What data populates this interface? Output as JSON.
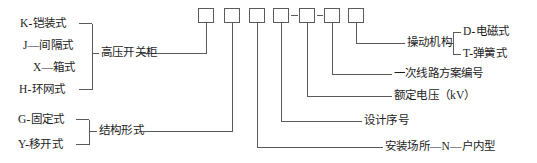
{
  "diagram": {
    "type": "code-breakdown-bracket-diagram",
    "line_color": "#5a5a5a",
    "text_color": "#1d1d1d",
    "background": "#ffffff",
    "code_boxes": {
      "count": 7,
      "separators": [
        "",
        "",
        "",
        "-",
        "-",
        "",
        ""
      ],
      "dash_label": "-"
    },
    "left_groups": [
      {
        "name": "cabinet-type-group",
        "items": [
          {
            "code": "K",
            "sep": "-",
            "text": "铠装式",
            "label": "K-铠装式"
          },
          {
            "code": "J",
            "sep": "-",
            "text": "间隔式",
            "label": "J—间隔式"
          },
          {
            "code": "X",
            "sep": "-",
            "text": "箱式",
            "label": "X—箱式"
          },
          {
            "code": "H",
            "sep": "-",
            "text": "环网式",
            "label": "H-环网式"
          }
        ],
        "group_label": "高压开关柜"
      },
      {
        "name": "structure-form-group",
        "items": [
          {
            "code": "G",
            "sep": "-",
            "text": "固定式",
            "label": "G-固定式"
          },
          {
            "code": "Y",
            "sep": "-",
            "text": "移开式",
            "label": "Y-移开式"
          }
        ],
        "group_label": "结构形式"
      }
    ],
    "right_labels": [
      {
        "name": "operating-mechanism",
        "label": "操动机构",
        "sub_items": [
          {
            "code": "D",
            "sep": "-",
            "text": "电磁式",
            "label": "D-电磁式"
          },
          {
            "code": "T",
            "sep": "-",
            "text": "弹簧式",
            "label": "T-弹簧式"
          }
        ]
      },
      {
        "name": "primary-circuit-scheme-number",
        "label": "一次线路方案编号"
      },
      {
        "name": "rated-voltage",
        "label": "额定电压（kV）"
      },
      {
        "name": "design-serial-number",
        "label": "设计序号"
      },
      {
        "name": "installation-site",
        "label": "安装场所—N—户内型"
      }
    ]
  }
}
